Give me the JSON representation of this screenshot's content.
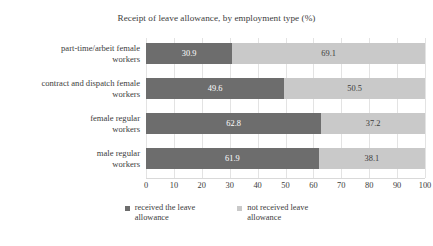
{
  "chart_data": {
    "type": "bar",
    "orientation": "horizontal",
    "stacked": true,
    "title": "Receipt of leave allowance, by employment type (%)",
    "xlabel": "",
    "ylabel": "",
    "xlim": [
      0,
      100
    ],
    "xticks": [
      "0",
      "10",
      "20",
      "30",
      "40",
      "50",
      "60",
      "70",
      "80",
      "90",
      "100"
    ],
    "grid": true,
    "legend_position": "bottom",
    "categories": [
      "part-time/arbeit female workers",
      "contract and dispatch female workers",
      "female regular workers",
      "male regular workers"
    ],
    "category_lines": [
      [
        "part-time/arbeit female",
        "workers"
      ],
      [
        "contract and dispatch female",
        "workers"
      ],
      [
        "female regular",
        "workers"
      ],
      [
        "male regular",
        "workers"
      ]
    ],
    "series": [
      {
        "name": "received the leave allowance",
        "color": "#6d6d6d",
        "values": [
          30.9,
          49.6,
          62.8,
          61.9
        ],
        "labels": [
          "30.9",
          "49.6",
          "62.8",
          "61.9"
        ]
      },
      {
        "name": "not received leave allowance",
        "color": "#c9c9c9",
        "values": [
          69.1,
          50.5,
          37.2,
          38.1
        ],
        "labels": [
          "69.1",
          "50.5",
          "37.2",
          "38.1"
        ]
      }
    ]
  },
  "legend": {
    "items": [
      {
        "label_lines": [
          "received the leave",
          "allowance"
        ],
        "color": "#6d6d6d"
      },
      {
        "label_lines": [
          "not received leave",
          "allowance"
        ],
        "color": "#c9c9c9"
      }
    ]
  }
}
